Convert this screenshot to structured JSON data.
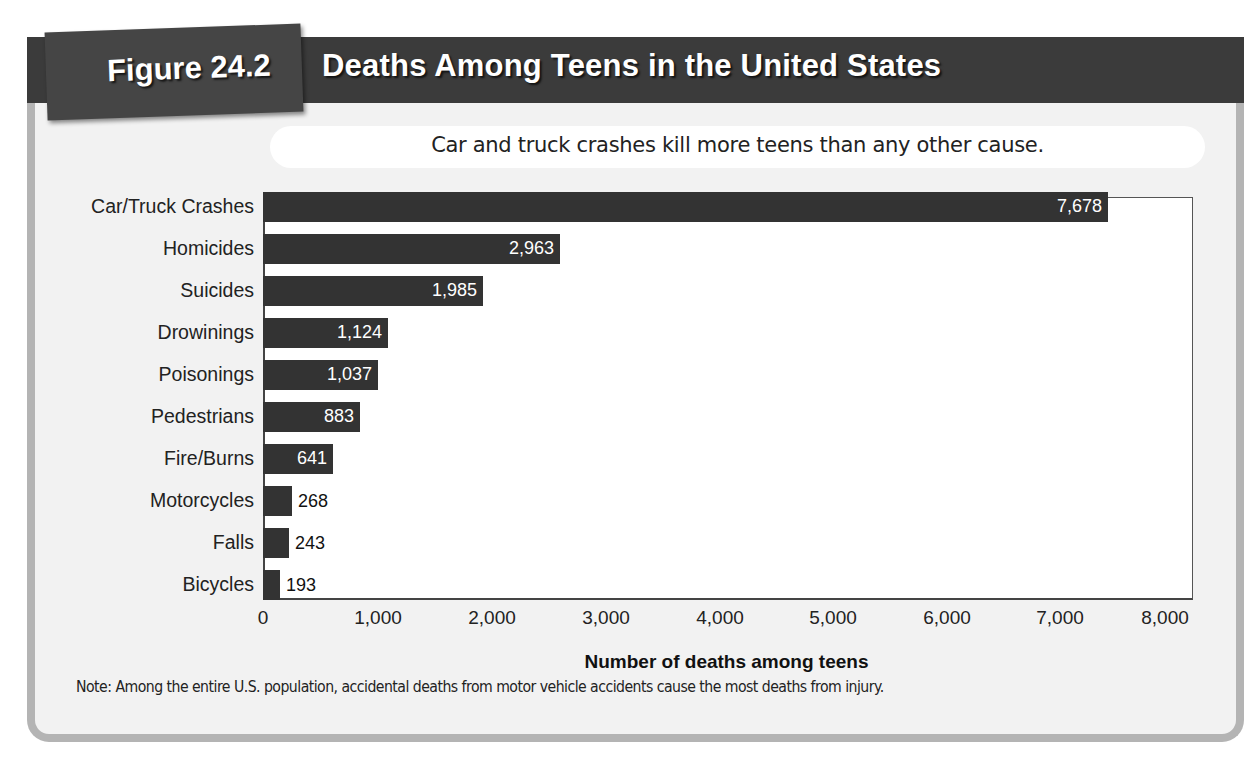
{
  "figure": {
    "label": "Figure 24.2",
    "title": "Deaths Among Teens in the United States",
    "subtitle": "Car and truck crashes kill more teens than any other cause.",
    "note": "Note: Among the entire U.S. population, accidental deaths from motor vehicle accidents cause the most deaths from injury.",
    "colors": {
      "header": "#3b3b3b",
      "bar": "#333333",
      "card": "#f2f2f2",
      "card_border": "#b4b4b4"
    }
  },
  "bars": [
    {
      "label": "Car/Truck Crashes",
      "value_text": "7,678",
      "px": 845,
      "inside": true
    },
    {
      "label": "Homicides",
      "value_text": "2,963",
      "px": 297,
      "inside": true
    },
    {
      "label": "Suicides",
      "value_text": "1,985",
      "px": 220,
      "inside": true
    },
    {
      "label": "Drowinings",
      "value_text": "1,124",
      "px": 125,
      "inside": true
    },
    {
      "label": "Poisonings",
      "value_text": "1,037",
      "px": 115,
      "inside": true
    },
    {
      "label": "Pedestrians",
      "value_text": "883",
      "px": 97,
      "inside": true
    },
    {
      "label": "Fire/Burns",
      "value_text": "641",
      "px": 70,
      "inside": true
    },
    {
      "label": "Motorcycles",
      "value_text": "268",
      "px": 29,
      "inside": false
    },
    {
      "label": "Falls",
      "value_text": "243",
      "px": 26,
      "inside": false
    },
    {
      "label": "Bicycles",
      "value_text": "193",
      "px": 17,
      "inside": false
    }
  ],
  "axis": {
    "xlabel": "Number of deaths among teens",
    "ticks": [
      {
        "label": "0",
        "x": 263
      },
      {
        "label": "1,000",
        "x": 378
      },
      {
        "label": "2,000",
        "x": 492
      },
      {
        "label": "3,000",
        "x": 606
      },
      {
        "label": "4,000",
        "x": 720
      },
      {
        "label": "5,000",
        "x": 833
      },
      {
        "label": "6,000",
        "x": 947
      },
      {
        "label": "7,000",
        "x": 1060
      },
      {
        "label": "8,000",
        "x": 1165
      }
    ]
  },
  "chart_data": {
    "type": "bar",
    "orientation": "horizontal",
    "title": "Deaths Among Teens in the United States",
    "subtitle": "Car and truck crashes kill more teens than any other cause.",
    "categories": [
      "Car/Truck Crashes",
      "Homicides",
      "Suicides",
      "Drowinings",
      "Poisonings",
      "Pedestrians",
      "Fire/Burns",
      "Motorcycles",
      "Falls",
      "Bicycles"
    ],
    "values": [
      7678,
      2963,
      1985,
      1124,
      1037,
      883,
      641,
      268,
      243,
      193
    ],
    "xlabel": "Number of deaths among teens",
    "ylabel": "",
    "xlim": [
      0,
      8000
    ],
    "xticks": [
      0,
      1000,
      2000,
      3000,
      4000,
      5000,
      6000,
      7000,
      8000
    ],
    "grid": false,
    "legend": null,
    "annotations": [
      "Note: Among the entire U.S. population, accidental deaths from motor vehicle accidents cause the most deaths from injury."
    ]
  }
}
